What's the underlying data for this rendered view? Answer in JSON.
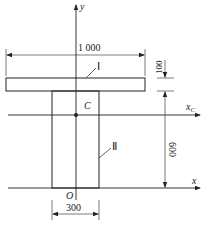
{
  "diagram": {
    "type": "cross-section",
    "shape": "T-section",
    "axes": {
      "y_label": "y",
      "x_label": "x",
      "xc_label": "x",
      "xc_sub": "C",
      "origin_label": "O",
      "centroid_label": "C"
    },
    "parts": [
      {
        "id": "I",
        "label": "Ⅰ",
        "name": "flange"
      },
      {
        "id": "II",
        "label": "Ⅱ",
        "name": "web"
      }
    ],
    "dimensions": {
      "flange_width": "1 000",
      "flange_thickness": "100",
      "web_height": "600",
      "web_width": "300"
    },
    "colors": {
      "line": "#222222",
      "background": "#ffffff"
    }
  }
}
